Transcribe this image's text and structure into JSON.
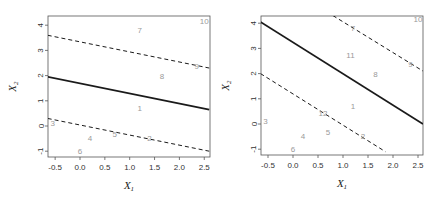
{
  "chart_data": [
    {
      "type": "scatter",
      "panel": "left",
      "title": "",
      "xlabel": "X_1",
      "ylabel": "X_2",
      "xlim": [
        -0.65,
        2.6
      ],
      "ylim": [
        -1.2,
        4.3
      ],
      "xticks": [
        "-0.5",
        "0.0",
        "0.5",
        "1.0",
        "1.5",
        "2.0",
        "2.5"
      ],
      "yticks": [
        "-1",
        "0",
        "1",
        "2",
        "3",
        "4"
      ],
      "grid": false,
      "points": [
        {
          "label": "1",
          "x": 1.2,
          "y": 0.7
        },
        {
          "label": "2",
          "x": 1.4,
          "y": -0.5
        },
        {
          "label": "3",
          "x": -0.55,
          "y": 0.1
        },
        {
          "label": "4",
          "x": 0.2,
          "y": -0.5
        },
        {
          "label": "5",
          "x": 0.7,
          "y": -0.35
        },
        {
          "label": "6",
          "x": 0.0,
          "y": -1.0
        },
        {
          "label": "7",
          "x": 1.2,
          "y": 3.8
        },
        {
          "label": "8",
          "x": 1.65,
          "y": 1.95
        },
        {
          "label": "9",
          "x": 2.35,
          "y": 2.35
        },
        {
          "label": "10",
          "x": 2.5,
          "y": 4.15
        }
      ],
      "lines": [
        {
          "name": "hyperplane",
          "style": "solid",
          "x": [
            -0.65,
            2.6
          ],
          "y": [
            1.95,
            0.65
          ]
        },
        {
          "name": "margin-upper",
          "style": "dashed",
          "x": [
            -0.65,
            2.6
          ],
          "y": [
            3.6,
            2.3
          ]
        },
        {
          "name": "margin-lower",
          "style": "dashed",
          "x": [
            -0.65,
            2.6
          ],
          "y": [
            0.3,
            -1.0
          ]
        }
      ]
    },
    {
      "type": "scatter",
      "panel": "right",
      "title": "",
      "xlabel": "X_1",
      "ylabel": "X_2",
      "xlim": [
        -0.65,
        2.6
      ],
      "ylim": [
        -1.2,
        4.3
      ],
      "xticks": [
        "-0.5",
        "0.0",
        "0.5",
        "1.0",
        "1.5",
        "2.0",
        "2.5"
      ],
      "yticks": [
        "-1",
        "0",
        "1",
        "2",
        "3",
        "4"
      ],
      "grid": false,
      "points": [
        {
          "label": "1",
          "x": 1.2,
          "y": 0.7
        },
        {
          "label": "2",
          "x": 1.4,
          "y": -0.5
        },
        {
          "label": "3",
          "x": -0.55,
          "y": 0.1
        },
        {
          "label": "4",
          "x": 0.2,
          "y": -0.5
        },
        {
          "label": "5",
          "x": 0.7,
          "y": -0.35
        },
        {
          "label": "6",
          "x": 0.0,
          "y": -1.0
        },
        {
          "label": "7",
          "x": 1.2,
          "y": 3.8
        },
        {
          "label": "8",
          "x": 1.65,
          "y": 1.95
        },
        {
          "label": "9",
          "x": 2.35,
          "y": 2.35
        },
        {
          "label": "10",
          "x": 2.5,
          "y": 4.15
        },
        {
          "label": "11",
          "x": 1.15,
          "y": 2.7
        },
        {
          "label": "12",
          "x": 0.6,
          "y": 0.4
        }
      ],
      "lines": [
        {
          "name": "hyperplane",
          "style": "solid",
          "x": [
            -0.65,
            2.6
          ],
          "y": [
            4.05,
            0.0
          ]
        },
        {
          "name": "margin-upper",
          "style": "dashed",
          "x": [
            0.8,
            2.6
          ],
          "y": [
            4.3,
            2.1
          ]
        },
        {
          "name": "margin-lower",
          "style": "dashed",
          "x": [
            -0.65,
            1.85
          ],
          "y": [
            2.0,
            -1.1
          ]
        }
      ]
    }
  ],
  "labels": {
    "xlabel_main": "X",
    "xlabel_sub": "1",
    "ylabel_main": "X",
    "ylabel_sub": "2"
  },
  "colors": {
    "line": "#1a1a1a",
    "point_label": "#9a9a9a",
    "axis": "#555555"
  }
}
